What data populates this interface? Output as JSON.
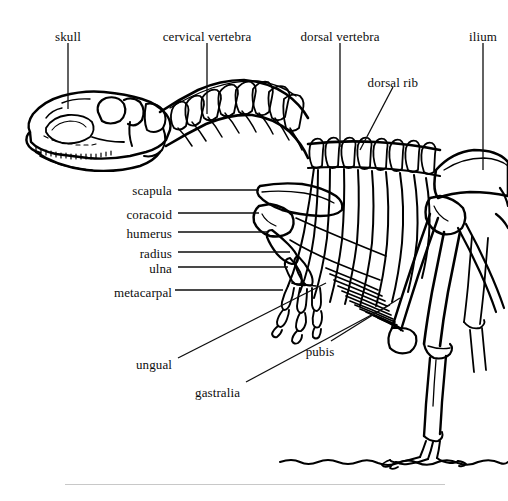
{
  "figure": {
    "background_color": "#ffffff",
    "ink_color": "#000000",
    "rule_color": "#c8c8c8"
  },
  "labels": [
    {
      "id": "skull",
      "text": "skull",
      "x": 68,
      "y": 30,
      "align": "center",
      "leader": {
        "type": "line",
        "x1": 68,
        "y1": 43,
        "x2": 68,
        "y2": 109
      }
    },
    {
      "id": "cervical-vertebra",
      "text": "cervical vertebra",
      "x": 207,
      "y": 30,
      "align": "center",
      "leader": {
        "type": "line",
        "x1": 207,
        "y1": 43,
        "x2": 207,
        "y2": 114
      }
    },
    {
      "id": "dorsal-vertebra",
      "text": "dorsal vertebra",
      "x": 340,
      "y": 30,
      "align": "center",
      "leader": {
        "type": "line",
        "x1": 340,
        "y1": 43,
        "x2": 340,
        "y2": 147
      }
    },
    {
      "id": "ilium",
      "text": "ilium",
      "x": 483,
      "y": 30,
      "align": "center",
      "leader": {
        "type": "line",
        "x1": 483,
        "y1": 43,
        "x2": 483,
        "y2": 170
      }
    },
    {
      "id": "dorsal-rib",
      "text": "dorsal rib",
      "x": 418,
      "y": 76,
      "align": "right",
      "leader": {
        "type": "line",
        "x1": 393,
        "y1": 87,
        "x2": 360,
        "y2": 150
      }
    },
    {
      "id": "scapula",
      "text": "scapula",
      "x": 172,
      "y": 184,
      "align": "right",
      "leader": {
        "type": "line",
        "x1": 178,
        "y1": 190,
        "x2": 259,
        "y2": 190
      }
    },
    {
      "id": "coracoid",
      "text": "coracoid",
      "x": 172,
      "y": 208,
      "align": "right",
      "leader": {
        "type": "line",
        "x1": 178,
        "y1": 213,
        "x2": 259,
        "y2": 213
      }
    },
    {
      "id": "humerus",
      "text": "humerus",
      "x": 172,
      "y": 227,
      "align": "right",
      "leader": {
        "type": "line",
        "x1": 178,
        "y1": 232,
        "x2": 268,
        "y2": 232
      }
    },
    {
      "id": "radius",
      "text": "radius",
      "x": 172,
      "y": 247,
      "align": "right",
      "leader": {
        "type": "line",
        "x1": 178,
        "y1": 252,
        "x2": 290,
        "y2": 252
      }
    },
    {
      "id": "ulna",
      "text": "ulna",
      "x": 172,
      "y": 262,
      "align": "right",
      "leader": {
        "type": "line",
        "x1": 178,
        "y1": 267,
        "x2": 288,
        "y2": 267
      }
    },
    {
      "id": "metacarpal",
      "text": "metacarpal",
      "x": 172,
      "y": 286,
      "align": "right",
      "leader": {
        "type": "line",
        "x1": 175,
        "y1": 290,
        "x2": 283,
        "y2": 290
      }
    },
    {
      "id": "ungual",
      "text": "ungual",
      "x": 172,
      "y": 358,
      "align": "right",
      "leader": {
        "type": "line",
        "x1": 178,
        "y1": 358,
        "x2": 326,
        "y2": 283
      }
    },
    {
      "id": "gastralia",
      "text": "gastralia",
      "x": 240,
      "y": 386,
      "align": "right",
      "leader": {
        "type": "line",
        "x1": 246,
        "y1": 382,
        "x2": 390,
        "y2": 305
      }
    },
    {
      "id": "pubis",
      "text": "pubis",
      "x": 320,
      "y": 345,
      "align": "center",
      "leader": {
        "type": "line",
        "x1": 331,
        "y1": 341,
        "x2": 400,
        "y2": 298
      }
    }
  ],
  "rule": {
    "x": 65,
    "y": 484,
    "width": 380
  },
  "chart_data": {
    "type": "table",
    "categories": [
      "skull",
      "cervical vertebra",
      "dorsal vertebra",
      "ilium",
      "dorsal rib",
      "scapula",
      "coracoid",
      "humerus",
      "radius",
      "ulna",
      "metacarpal",
      "ungual",
      "gastralia",
      "pubis"
    ],
    "values": [
      1,
      1,
      1,
      1,
      1,
      1,
      1,
      1,
      1,
      1,
      1,
      1,
      1,
      1
    ],
    "xlabel": "",
    "ylabel": ""
  }
}
